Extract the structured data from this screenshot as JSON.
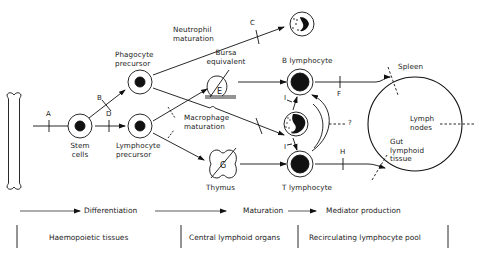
{
  "diagram": {
    "nodes": {
      "bone": {
        "label": ""
      },
      "stem_cells": {
        "label_line1": "Stem",
        "label_line2": "cells"
      },
      "phagocyte_precursor": {
        "label_line1": "Phagocyte",
        "label_line2": "precursor"
      },
      "lymphocyte_precursor": {
        "label_line1": "Lymphocyte",
        "label_line2": "precursor"
      },
      "neutrophil": {
        "label_line1": "Neutrophil",
        "label_line2": "maturation"
      },
      "bursa_equivalent": {
        "label_line1": "Bursa",
        "label_line2": "equivalent",
        "inner_letter": "E"
      },
      "macrophage": {
        "label_line1": "Macrophage",
        "label_line2": "maturation"
      },
      "thymus": {
        "label": "Thymus",
        "inner_letter": "G"
      },
      "b_lymphocyte": {
        "label": "B lymphocyte"
      },
      "t_lymphocyte": {
        "label": "T lymphocyte"
      },
      "spleen": {
        "label": "Spleen"
      },
      "lymph_nodes": {
        "label_line1": "Lymph",
        "label_line2": "nodes"
      },
      "gut_lymphoid_tissue": {
        "label_line1": "Gut",
        "label_line2": "lymphoid",
        "label_line3": "tissue"
      }
    },
    "block_markers": {
      "A": "A",
      "B": "B",
      "C": "C",
      "D": "D",
      "F": "F",
      "H": "H",
      "I_top": "I",
      "I_bottom": "I",
      "question": "?"
    },
    "process_axis": {
      "differentiation": "Differentiation",
      "maturation": "Maturation",
      "mediator_production": "Mediator production"
    },
    "tissue_bands": {
      "haemopoietic": "Haemopoietic tissues",
      "central": "Central lymphoid organs",
      "recirculating": "Recirculating lymphocyte pool"
    }
  }
}
